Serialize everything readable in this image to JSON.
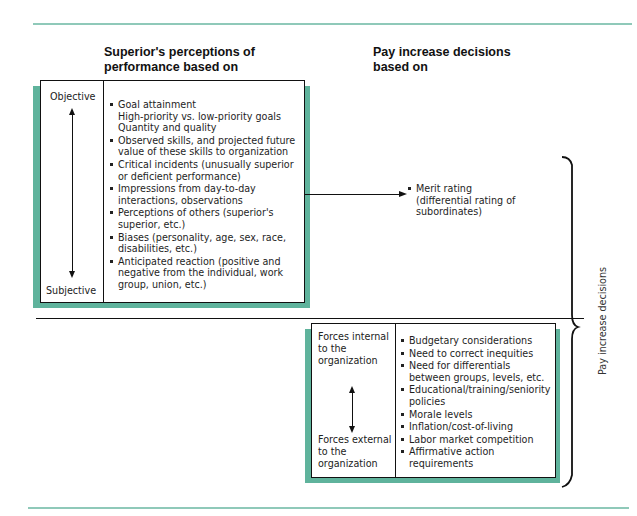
{
  "headings": {
    "left": [
      "Superior's perceptions of",
      "performance based on"
    ],
    "right": [
      "Pay increase decisions",
      "based on"
    ]
  },
  "top_box": {
    "scale_top": "Objective",
    "scale_bottom": "Subjective",
    "items": [
      {
        "text": "Goal attainment",
        "sub": [
          "High-priority vs. low-priority goals",
          "Quantity and quality"
        ]
      },
      {
        "text": "Observed skills, and projected future value of these skills to organization"
      },
      {
        "text": "Critical incidents (unusually superior or deficient performance)"
      },
      {
        "text": "Impressions from day-to-day interactions, observations"
      },
      {
        "text": "Perceptions of others (superior's superior, etc.)"
      },
      {
        "text": "Biases (personality, age, sex, race, disabilities, etc.)"
      },
      {
        "text": "Anticipated reaction (positive and negative from the individual, work group, union, etc.)"
      }
    ]
  },
  "merit": {
    "item": "Merit rating",
    "detail": "(differential rating of subordinates)"
  },
  "bottom_box": {
    "scale_top": "Forces internal to the organization",
    "scale_bottom": "Forces external to the organization",
    "items": [
      {
        "text": "Budgetary considerations"
      },
      {
        "text": "Need to correct inequities"
      },
      {
        "text": "Need for differentials between groups, levels, etc."
      },
      {
        "text": "Educational/training/seniority policies"
      },
      {
        "text": "Morale levels"
      },
      {
        "text": "Inflation/cost-of-living"
      },
      {
        "text": "Labor market competition"
      },
      {
        "text": "Affirmative action requirements"
      }
    ]
  },
  "bracket_label": "Pay increase decisions",
  "colors": {
    "accent_teal": "#5fb39c",
    "rule_teal": "#8fc9b9",
    "line": "#111111"
  }
}
